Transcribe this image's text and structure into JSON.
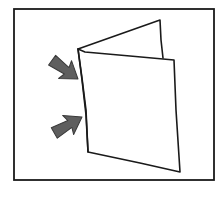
{
  "diagram": {
    "description": "Hand-drawn folded card with two arrows pointing at the fold",
    "frame": {
      "x": 14,
      "y": 9,
      "width": 200,
      "height": 171,
      "stroke": "#1a1a1a"
    },
    "back_page": {
      "points": [
        [
          78,
          49
        ],
        [
          160,
          20
        ],
        [
          164,
          57
        ]
      ],
      "stroke": "#1a1a1a",
      "fill": "#ffffff"
    },
    "front_page": {
      "points": [
        [
          78,
          49
        ],
        [
          85,
          52
        ],
        [
          174,
          60
        ],
        [
          180,
          172
        ],
        [
          88,
          152
        ]
      ],
      "stroke": "#1a1a1a",
      "fill": "#ffffff"
    },
    "arrows": [
      {
        "id": "upper",
        "from": [
          37,
          50
        ],
        "to": [
          78,
          79
        ],
        "color": "#5e5e5e",
        "stroke": "#3a3a3a"
      },
      {
        "id": "lower",
        "from": [
          42,
          139
        ],
        "to": [
          82,
          117
        ],
        "color": "#5e5e5e",
        "stroke": "#3a3a3a"
      }
    ]
  }
}
